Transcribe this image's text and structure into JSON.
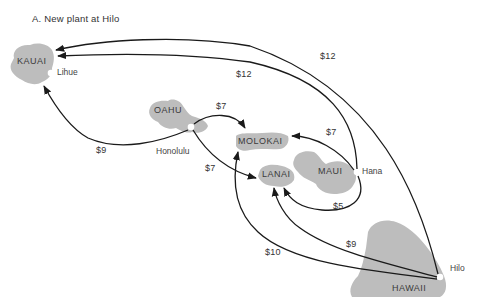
{
  "title": "A.  New plant at Hilo",
  "islands": {
    "kauai": "KAUAI",
    "oahu": "OAHU",
    "molokai": "MOLOKAI",
    "lanai": "LANAI",
    "maui": "MAUI",
    "hawaii": "HAWAII"
  },
  "cities": {
    "lihue": "Lihue",
    "honolulu": "Honolulu",
    "hana": "Hana",
    "hilo": "Hilo"
  },
  "costs": {
    "hilo_to_kauai": "$12",
    "hana_to_kauai": "$12",
    "honolulu_to_kauai": "$9",
    "honolulu_to_molokai": "$7",
    "honolulu_to_lanai": "$7",
    "hana_to_molokai": "$7",
    "hana_to_lanai": "$5",
    "hilo_to_lanai": "$9",
    "hilo_to_molokai": "$10"
  },
  "colors": {
    "island_fill": "#bdbdbd",
    "arrow": "#1a1a1a",
    "city_dot": "#ffffff"
  }
}
